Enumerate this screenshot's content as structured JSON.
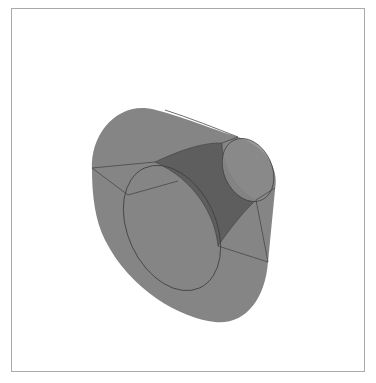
{
  "figure": {
    "colors": {
      "background": "#ffffff",
      "frame": "#a9a9a9",
      "body_fill": "#858585",
      "inner_fill": "#5e5e5e",
      "cap_fill": "#8a8a8a",
      "edge_stroke": "#3f3f3f"
    }
  }
}
